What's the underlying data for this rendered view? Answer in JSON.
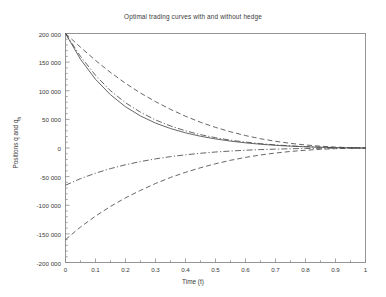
{
  "chart_data": {
    "type": "line",
    "title": "Optimal trading curves with and without hedge",
    "xlabel": "Time (t)",
    "ylabel": "Positions q and q",
    "ylabel_sub": "h",
    "xlim": [
      0,
      1
    ],
    "ylim": [
      -200000,
      200000
    ],
    "grid": false,
    "legend": "none",
    "xticks": [
      0,
      0.1,
      0.2,
      0.3,
      0.4,
      0.5,
      0.6,
      0.7,
      0.8,
      0.9,
      1
    ],
    "xtick_labels": [
      "0",
      "0.1",
      "0.2",
      "0.3",
      "0.4",
      "0.5",
      "0.6",
      "0.7",
      "0.8",
      "0.9",
      "1"
    ],
    "yticks": [
      200000,
      150000,
      100000,
      50000,
      0,
      -50000,
      -100000,
      -150000,
      -200000
    ],
    "ytick_labels": [
      "200 000",
      "150 000",
      "100 000",
      "50 000",
      "0",
      "-50 000",
      "-100 000",
      "-150 000",
      "-200 000"
    ],
    "minor_tick_count": 4,
    "axis_color": "#8a8a8a",
    "line_color": "#4a4a4a",
    "x": [
      0,
      0.05,
      0.1,
      0.15,
      0.2,
      0.25,
      0.3,
      0.35,
      0.4,
      0.45,
      0.5,
      0.55,
      0.6,
      0.65,
      0.7,
      0.75,
      0.8,
      0.85,
      0.9,
      0.95,
      1
    ],
    "series": [
      {
        "name": "q solid",
        "style": "solid",
        "values": [
          200000,
          155000,
          120000,
          93000,
          72000,
          56000,
          43500,
          34000,
          26500,
          20500,
          15800,
          12000,
          9000,
          6600,
          4700,
          3200,
          2100,
          1250,
          650,
          230,
          0
        ]
      },
      {
        "name": "q dash-dot upper",
        "style": "dash-dot",
        "values": [
          200000,
          160000,
          127000,
          100000,
          79000,
          62500,
          49000,
          38500,
          30000,
          23300,
          18000,
          13700,
          10300,
          7600,
          5400,
          3700,
          2400,
          1400,
          730,
          260,
          0
        ]
      },
      {
        "name": "q dashed upper",
        "style": "dashed",
        "values": [
          200000,
          176000,
          153000,
          132000,
          113000,
          96000,
          81000,
          67500,
          55500,
          45000,
          36000,
          28300,
          21700,
          16200,
          11700,
          8100,
          5300,
          3100,
          1600,
          560,
          0
        ]
      },
      {
        "name": "qh dash-dot lower",
        "style": "dash-dot",
        "values": [
          -65000,
          -53500,
          -44000,
          -36000,
          -29300,
          -23700,
          -19000,
          -15100,
          -11900,
          -9200,
          -7000,
          -5300,
          -3900,
          -2800,
          -1950,
          -1320,
          -850,
          -500,
          -260,
          -90,
          0
        ]
      },
      {
        "name": "qh dashed lower",
        "style": "dashed",
        "values": [
          -160000,
          -138000,
          -119000,
          -102000,
          -87000,
          -74000,
          -62000,
          -51500,
          -42500,
          -34500,
          -27500,
          -21500,
          -16400,
          -12200,
          -8800,
          -6000,
          -3900,
          -2300,
          -1150,
          -400,
          0
        ]
      }
    ]
  }
}
